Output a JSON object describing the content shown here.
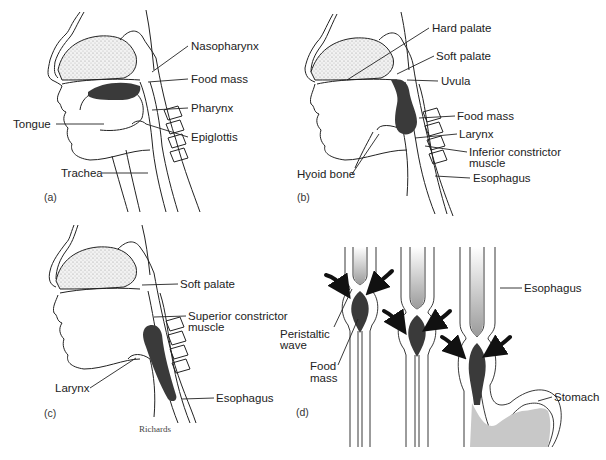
{
  "figure": {
    "credit": "Richards",
    "ink_color": "#222222",
    "food_mass_color": "#3a3a3a",
    "stomach_contents_color": "#c8c8c8"
  },
  "panels": [
    {
      "id": "a",
      "tag": "(a)",
      "labels": [
        "Nasopharynx",
        "Food mass",
        "Pharynx",
        "Tongue",
        "Epiglottis",
        "Trachea"
      ]
    },
    {
      "id": "b",
      "tag": "(b)",
      "labels": [
        "Hard palate",
        "Soft palate",
        "Uvula",
        "Food mass",
        "Larynx",
        "Inferior constrictor muscle",
        "Hyoid bone",
        "Esophagus"
      ]
    },
    {
      "id": "c",
      "tag": "(c)",
      "labels": [
        "Soft palate",
        "Superior constrictor muscle",
        "Larynx",
        "Esophagus"
      ]
    },
    {
      "id": "d",
      "tag": "(d)",
      "labels": [
        "Esophagus",
        "Peristaltic wave",
        "Food mass",
        "Stomach"
      ]
    }
  ],
  "a": {
    "tag": "(a)",
    "nasopharynx": "Nasopharynx",
    "food_mass": "Food mass",
    "pharynx": "Pharynx",
    "tongue": "Tongue",
    "epiglottis": "Epiglottis",
    "trachea": "Trachea"
  },
  "b": {
    "tag": "(b)",
    "hard_palate": "Hard palate",
    "soft_palate": "Soft palate",
    "uvula": "Uvula",
    "food_mass": "Food mass",
    "larynx": "Larynx",
    "inferior_constrictor_1": "Inferior constrictor",
    "inferior_constrictor_2": "muscle",
    "hyoid_bone": "Hyoid bone",
    "esophagus": "Esophagus"
  },
  "c": {
    "tag": "(c)",
    "soft_palate": "Soft palate",
    "superior_constrictor_1": "Superior constrictor",
    "superior_constrictor_2": "muscle",
    "larynx": "Larynx",
    "esophagus": "Esophagus",
    "credit": "Richards"
  },
  "d": {
    "tag": "(d)",
    "esophagus": "Esophagus",
    "peristaltic_1": "Peristaltic",
    "peristaltic_2": "wave",
    "food_1": "Food",
    "food_2": "mass",
    "stomach": "Stomach"
  }
}
